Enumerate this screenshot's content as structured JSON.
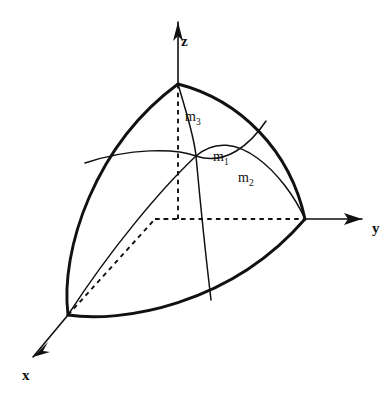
{
  "figure": {
    "background_color": "#ffffff",
    "stroke_color": "#111111",
    "width": 392,
    "height": 398
  },
  "axes": [
    {
      "id": "x",
      "label": "x",
      "label_x": 22,
      "label_y": 380,
      "direction": "down-left",
      "from": {
        "x": 68,
        "y": 315
      },
      "to": {
        "x": 33,
        "y": 357
      },
      "arrow": true
    },
    {
      "id": "y",
      "label": "y",
      "label_x": 372,
      "label_y": 233,
      "direction": "right",
      "from": {
        "x": 305,
        "y": 219
      },
      "to": {
        "x": 362,
        "y": 219
      },
      "arrow": true
    },
    {
      "id": "z",
      "label": "z",
      "label_x": 181,
      "label_y": 46,
      "direction": "up",
      "from": {
        "x": 178,
        "y": 84
      },
      "to": {
        "x": 178,
        "y": 22
      },
      "arrow": true
    }
  ],
  "vertices": {
    "origin": {
      "x": 68,
      "y": 315
    },
    "z_point": {
      "x": 178,
      "y": 84
    },
    "y_point": {
      "x": 305,
      "y": 219
    },
    "center": {
      "x": 196,
      "y": 156
    }
  },
  "boundary_arcs": [
    {
      "name": "left-boundary-arc",
      "description": "origin to z vertex, bulging left",
      "path": "M 68 315 C 60 250 95 145 178 84"
    },
    {
      "name": "upper-right-boundary-arc",
      "description": "z vertex to y vertex, bulging up-right",
      "path": "M 178 84 C 240 100 290 150 305 219"
    },
    {
      "name": "bottom-boundary-arc",
      "description": "origin to y vertex, sagging downward",
      "path": "M 68 315 C 120 323 230 306 305 219"
    }
  ],
  "meridian_arcs": [
    {
      "id": "m1",
      "label": "m",
      "subscript": "1",
      "label_x": 213,
      "label_y": 161,
      "description": "arc from left boundary through center to upper-right boundary",
      "path": "M 85 163 C 130 148 175 148 196 156 C 225 166 250 145 266 121"
    },
    {
      "id": "m2",
      "label": "m",
      "subscript": "2",
      "label_x": 238,
      "label_y": 182,
      "description": "arc from origin through center to y vertex",
      "path": "M 68 315 C 110 250 160 190 196 156 C 235 122 285 175 305 219"
    },
    {
      "id": "m3",
      "label": "m",
      "subscript": "3",
      "label_x": 185,
      "label_y": 121,
      "description": "arc from z vertex through center down to bottom arc",
      "path": "M 178 84 C 186 112 194 135 196 156 C 200 200 206 258 211 300"
    }
  ],
  "hidden_edges": [
    {
      "name": "vertical-hidden-edge",
      "description": "dashed vertical from z vertex to box corner",
      "path": "M 178 84 L 178 219"
    },
    {
      "name": "horizontal-hidden-edge",
      "description": "dashed horizontal from box corner to y vertex",
      "path": "M 155 219 L 305 219"
    },
    {
      "name": "diagonal-hidden-edge",
      "description": "dashed diagonal from origin to box corner",
      "path": "M 68 315 L 155 219"
    },
    {
      "name": "corner-connector-hidden-edge",
      "description": "dashed short segment joining vertical and horizontal",
      "path": "M 155 219 L 178 219"
    }
  ]
}
